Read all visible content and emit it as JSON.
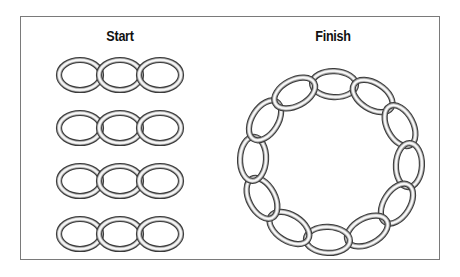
{
  "diagram": {
    "start_label": "Start",
    "finish_label": "Finish",
    "start": {
      "rows": 4,
      "links_per_row": 3,
      "row_centers_y": [
        75,
        128,
        181,
        234
      ],
      "link_centers_x": [
        80,
        120,
        160
      ],
      "link_rx": 21,
      "link_ry": 15
    },
    "finish": {
      "links": 12,
      "center": [
        331,
        162
      ],
      "radius": 78,
      "link_rx": 22,
      "link_ry": 13
    },
    "colors": {
      "border": "#7a7a7a",
      "ring_dark": "#3a3a3a",
      "ring_light": "#e8e8e8"
    }
  }
}
